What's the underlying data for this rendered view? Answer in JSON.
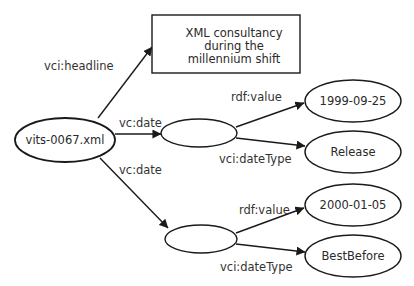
{
  "diagram": {
    "type": "rdf-graph",
    "nodes": {
      "subject": {
        "label": "vits-0067.xml",
        "shape": "ellipse"
      },
      "headline": {
        "lines": [
          "XML consultancy",
          "during  the",
          "millennium shift"
        ],
        "shape": "rectangle"
      },
      "blank1": {
        "label": "",
        "shape": "ellipse"
      },
      "blank2": {
        "label": "",
        "shape": "ellipse"
      },
      "value1": {
        "label": "1999-09-25",
        "shape": "ellipse"
      },
      "type1": {
        "label": "Release",
        "shape": "ellipse"
      },
      "value2": {
        "label": "2000-01-05",
        "shape": "ellipse"
      },
      "type2": {
        "label": "BestBefore",
        "shape": "ellipse"
      }
    },
    "edges": {
      "headline": {
        "from": "subject",
        "to": "headline",
        "label": "vci:headline"
      },
      "date1": {
        "from": "subject",
        "to": "blank1",
        "label": "vc:date"
      },
      "date2": {
        "from": "subject",
        "to": "blank2",
        "label": "vc:date"
      },
      "value1": {
        "from": "blank1",
        "to": "value1",
        "label": "rdf:value"
      },
      "type1": {
        "from": "blank1",
        "to": "type1",
        "label": "vci:dateType"
      },
      "value2": {
        "from": "blank2",
        "to": "value2",
        "label": "rdf:value"
      },
      "type2": {
        "from": "blank2",
        "to": "type2",
        "label": "vci:dateType"
      }
    }
  }
}
